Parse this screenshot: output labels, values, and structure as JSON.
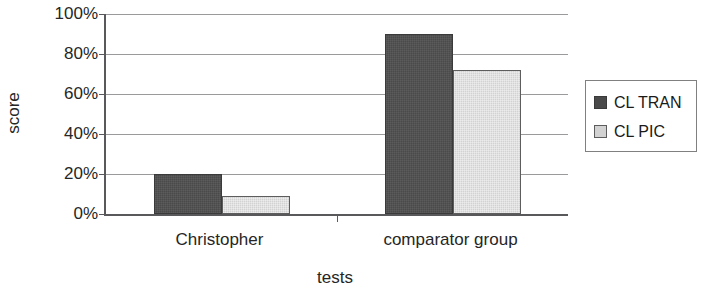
{
  "chart_data": {
    "type": "bar",
    "title": "",
    "xlabel": "tests",
    "ylabel": "score",
    "categories": [
      "Christopher",
      "comparator group"
    ],
    "series": [
      {
        "name": "CL TRAN",
        "color": "#4a4a4a",
        "values": [
          20,
          90
        ]
      },
      {
        "name": "CL PIC",
        "color": "#d2d2d2",
        "values": [
          9,
          72
        ]
      }
    ],
    "ylim": [
      0,
      100
    ],
    "ytick_values": [
      0,
      20,
      40,
      60,
      80,
      100
    ],
    "ytick_labels": [
      "0%",
      "20%",
      "40%",
      "60%",
      "80%",
      "100%"
    ],
    "grid": true,
    "grid_axis": "y",
    "legend_position": "right",
    "value_suffix": "%"
  }
}
